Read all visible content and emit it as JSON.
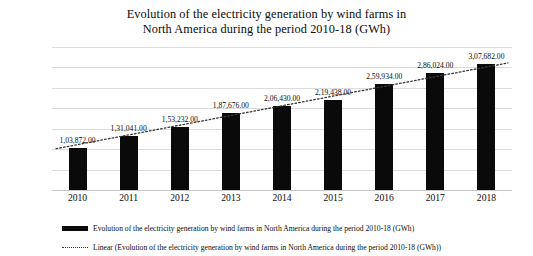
{
  "chart_data": {
    "type": "bar",
    "title": "Evolution of the electricity generation by wind farms in North America during the period 2010-18 (GWh)",
    "title_line1": "Evolution of the electricity generation by wind farms in",
    "title_line2": "North America during the period 2010-18 (GWh)",
    "xlabel": "",
    "ylabel": "",
    "categories": [
      "2010",
      "2011",
      "2012",
      "2013",
      "2014",
      "2015",
      "2016",
      "2017",
      "2018"
    ],
    "values": [
      103872,
      131041,
      153232,
      187676,
      206430,
      219438,
      259934,
      286024,
      307682
    ],
    "data_labels": [
      "1,03,872.00",
      "1,31,041.00",
      "1,53,232.00",
      "1,87,676.00",
      "2,06,430.00",
      "2,19,438.00",
      "2,59,934.00",
      "2,86,024.00",
      "3,07,682.00"
    ],
    "ylim": [
      0,
      350000
    ],
    "ytick_values": [
      350000,
      300000,
      250000,
      200000,
      150000,
      100000,
      50000,
      0
    ],
    "ytick_labels": [
      "350000",
      "300000",
      "250000",
      "200000",
      "150000",
      "100000",
      "50000",
      "0"
    ],
    "grid": true,
    "legend_position": "bottom",
    "series": [
      {
        "name": "Evolution of the electricity generation by wind farms in North America during the period 2010-18 (GWh)",
        "type": "bar",
        "color": "#0a0a0a",
        "values": [
          103872,
          131041,
          153232,
          187676,
          206430,
          219438,
          259934,
          286024,
          307682
        ]
      },
      {
        "name": "Linear (Evolution of the electricity generation by wind farms in North America during the period 2010-18 (GWh))",
        "type": "trendline",
        "style": "dotted",
        "color": "#3a3a3a",
        "start_value": 101000,
        "end_value": 311000
      }
    ],
    "colors": {
      "bar": "#0a0a0a",
      "trendline": "#3a3a3a",
      "gridline": "#dcdcdc",
      "background": "#ffffff",
      "text": "#0c0c0c"
    }
  },
  "legend": {
    "items": [
      {
        "marker": "solid-bar",
        "label": "Evolution of the electricity generation by wind farms in North America during the period 2010-18 (GWh)"
      },
      {
        "marker": "dotted-line",
        "label": "Linear (Evolution of the electricity generation by wind farms in North America during the period 2010-18 (GWh))"
      }
    ]
  }
}
